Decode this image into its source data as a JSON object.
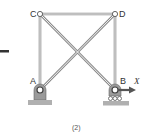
{
  "figure": {
    "caption": "(2)",
    "dash_mark": "—"
  },
  "joints": {
    "A": {
      "label": "A",
      "x": 40,
      "y": 90
    },
    "B": {
      "label": "B",
      "x": 115,
      "y": 90
    },
    "C": {
      "label": "C",
      "x": 40,
      "y": 14
    },
    "D": {
      "label": "D",
      "x": 115,
      "y": 14
    }
  },
  "members": [
    {
      "from": "A",
      "to": "C"
    },
    {
      "from": "C",
      "to": "D"
    },
    {
      "from": "D",
      "to": "B"
    },
    {
      "from": "A",
      "to": "D"
    },
    {
      "from": "C",
      "to": "B"
    }
  ],
  "supports": {
    "A": "pin",
    "B": "roller"
  },
  "load": {
    "label": "X",
    "at": "B",
    "direction": "right"
  },
  "colors": {
    "member": "#8a8a8a",
    "support": "#9a9a9a",
    "ground": "#b0b0b0",
    "arrow": "#555555",
    "dash": "#333333"
  }
}
